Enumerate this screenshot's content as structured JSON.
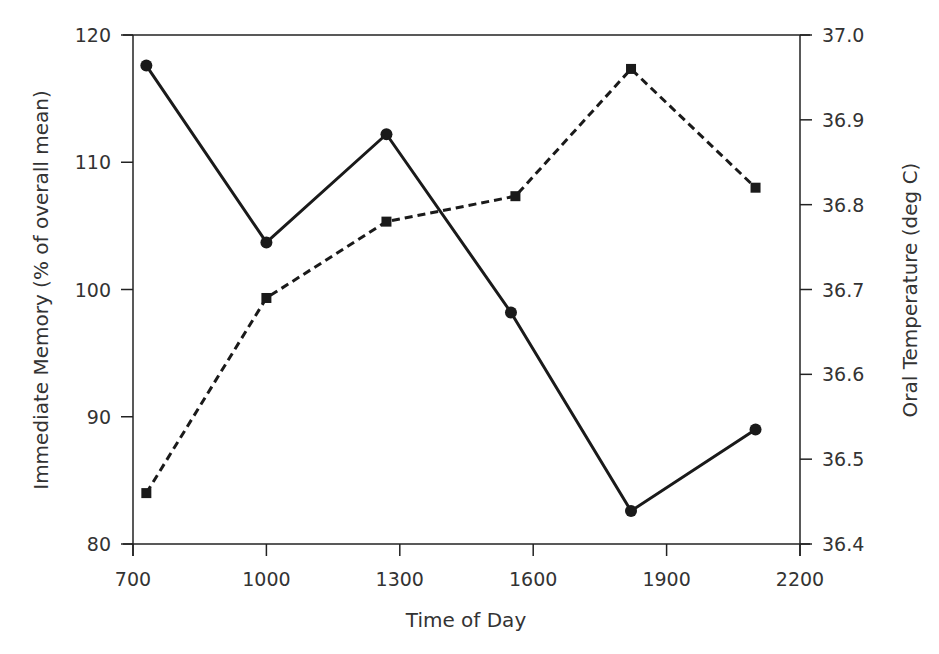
{
  "chart_data": {
    "type": "line",
    "title": "",
    "xlabel": "Time of Day",
    "ylabel": "Immediate Memory (% of overall mean)",
    "y2label": "Oral Temperature (deg C)",
    "xlim": [
      700,
      2200
    ],
    "ylim": [
      80,
      120
    ],
    "y2lim": [
      36.4,
      37.0
    ],
    "x_ticks": [
      "700",
      "1000",
      "1300",
      "1600",
      "1900",
      "2200"
    ],
    "y_ticks": [
      "80",
      "90",
      "100",
      "110",
      "120"
    ],
    "y2_ticks": [
      "36.4",
      "36.5",
      "36.6",
      "36.7",
      "36.8",
      "36.9",
      "37.0"
    ],
    "grid": false,
    "legend": null,
    "series": [
      {
        "name": "Immediate Memory",
        "axis": "left",
        "style": "solid",
        "marker": "circle",
        "x": [
          730,
          1000,
          1270,
          1550,
          1820,
          2100
        ],
        "values": [
          117.6,
          103.7,
          112.2,
          98.2,
          82.6,
          89.0
        ]
      },
      {
        "name": "Oral Temperature",
        "axis": "right",
        "style": "dashed",
        "marker": "square",
        "x": [
          730,
          1000,
          1270,
          1560,
          1820,
          2100
        ],
        "values": [
          36.46,
          36.69,
          36.78,
          36.81,
          36.96,
          36.82
        ]
      }
    ],
    "colors": {
      "line": "#1a1a1a",
      "axis": "#222222",
      "text": "#333333"
    }
  }
}
